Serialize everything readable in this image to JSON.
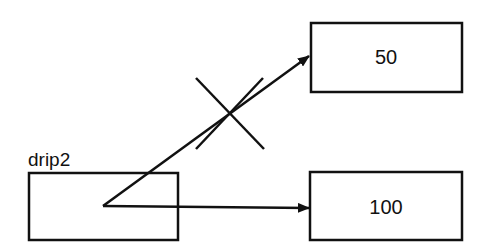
{
  "diagram": {
    "variable": {
      "name": "drip2"
    },
    "boxes": [
      {
        "id": "old-target",
        "value": "50"
      },
      {
        "id": "new-target",
        "value": "100"
      }
    ],
    "arrows": [
      {
        "from": "drip2",
        "to": "old-target",
        "status": "crossed-out"
      },
      {
        "from": "drip2",
        "to": "new-target",
        "status": "active"
      }
    ],
    "colors": {
      "stroke": "#111111",
      "background": "#ffffff"
    }
  }
}
